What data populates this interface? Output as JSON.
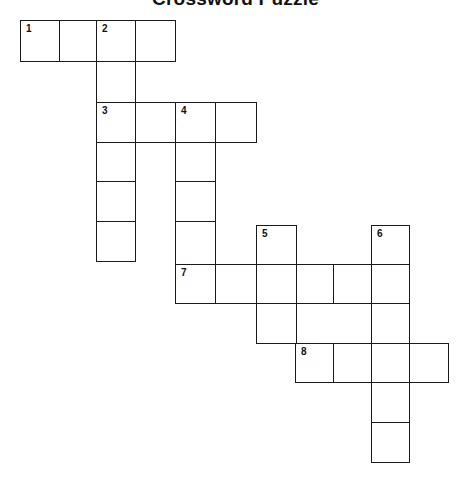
{
  "title": "Crossword Puzzle",
  "style": {
    "line_color": "#1a1a1a",
    "background": "#ffffff"
  },
  "grid": {
    "cells": [
      {
        "x": 20,
        "y": 20,
        "w": 40,
        "h": 42,
        "num": "1"
      },
      {
        "x": 59,
        "y": 20,
        "w": 38,
        "h": 42,
        "num": ""
      },
      {
        "x": 96,
        "y": 20,
        "w": 40,
        "h": 42,
        "num": "2"
      },
      {
        "x": 135,
        "y": 20,
        "w": 41,
        "h": 42,
        "num": ""
      },
      {
        "x": 96,
        "y": 61,
        "w": 40,
        "h": 42,
        "num": ""
      },
      {
        "x": 96,
        "y": 102,
        "w": 40,
        "h": 41,
        "num": "3"
      },
      {
        "x": 135,
        "y": 102,
        "w": 41,
        "h": 41,
        "num": ""
      },
      {
        "x": 175,
        "y": 102,
        "w": 41,
        "h": 41,
        "num": "4"
      },
      {
        "x": 215,
        "y": 102,
        "w": 42,
        "h": 41,
        "num": ""
      },
      {
        "x": 96,
        "y": 142,
        "w": 40,
        "h": 40,
        "num": ""
      },
      {
        "x": 96,
        "y": 181,
        "w": 40,
        "h": 41,
        "num": ""
      },
      {
        "x": 96,
        "y": 221,
        "w": 40,
        "h": 41,
        "num": ""
      },
      {
        "x": 175,
        "y": 142,
        "w": 41,
        "h": 40,
        "num": ""
      },
      {
        "x": 175,
        "y": 181,
        "w": 41,
        "h": 41,
        "num": ""
      },
      {
        "x": 175,
        "y": 221,
        "w": 41,
        "h": 44,
        "num": ""
      },
      {
        "x": 256,
        "y": 225,
        "w": 41,
        "h": 40,
        "num": "5"
      },
      {
        "x": 371,
        "y": 225,
        "w": 39,
        "h": 40,
        "num": "6"
      },
      {
        "x": 175,
        "y": 264,
        "w": 41,
        "h": 40,
        "num": "7"
      },
      {
        "x": 215,
        "y": 264,
        "w": 42,
        "h": 40,
        "num": ""
      },
      {
        "x": 256,
        "y": 264,
        "w": 41,
        "h": 40,
        "num": ""
      },
      {
        "x": 296,
        "y": 264,
        "w": 38,
        "h": 40,
        "num": ""
      },
      {
        "x": 333,
        "y": 264,
        "w": 39,
        "h": 40,
        "num": ""
      },
      {
        "x": 371,
        "y": 264,
        "w": 39,
        "h": 40,
        "num": ""
      },
      {
        "x": 256,
        "y": 303,
        "w": 41,
        "h": 41,
        "num": ""
      },
      {
        "x": 371,
        "y": 303,
        "w": 39,
        "h": 41,
        "num": ""
      },
      {
        "x": 295,
        "y": 343,
        "w": 39,
        "h": 40,
        "num": "8"
      },
      {
        "x": 333,
        "y": 343,
        "w": 39,
        "h": 40,
        "num": ""
      },
      {
        "x": 371,
        "y": 343,
        "w": 39,
        "h": 40,
        "num": ""
      },
      {
        "x": 409,
        "y": 343,
        "w": 40,
        "h": 40,
        "num": ""
      },
      {
        "x": 371,
        "y": 382,
        "w": 39,
        "h": 41,
        "num": ""
      },
      {
        "x": 371,
        "y": 422,
        "w": 39,
        "h": 41,
        "num": ""
      }
    ]
  },
  "clue_numbers": {
    "across": [
      "1",
      "3",
      "7",
      "8"
    ],
    "down": [
      "2",
      "4",
      "5",
      "6"
    ]
  }
}
